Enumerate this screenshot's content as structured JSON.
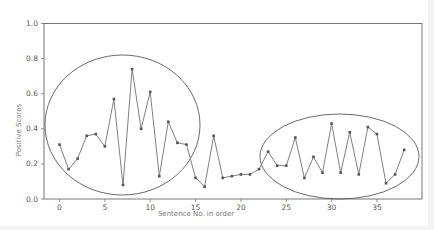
{
  "chart_data": {
    "type": "line",
    "title": "",
    "xlabel": "Sentence No. in order",
    "ylabel": "Positive Scores",
    "xlim": [
      -2,
      40
    ],
    "ylim": [
      0.0,
      1.0
    ],
    "x_ticks": [
      "0",
      "5",
      "10",
      "15",
      "20",
      "25",
      "30",
      "35"
    ],
    "y_ticks": [
      "0.0",
      "0.2",
      "0.4",
      "0.6",
      "0.8",
      "1.0"
    ],
    "grid": false,
    "legend": null,
    "x": [
      0,
      1,
      2,
      3,
      4,
      5,
      6,
      7,
      8,
      9,
      10,
      11,
      12,
      13,
      14,
      15,
      16,
      17,
      18,
      19,
      20,
      21,
      22,
      23,
      24,
      25,
      26,
      27,
      28,
      29,
      30,
      31,
      32,
      33,
      34,
      35,
      36,
      37,
      38
    ],
    "series": [
      {
        "name": "Positive Scores",
        "color": "#808080",
        "values": [
          0.31,
          0.17,
          0.23,
          0.36,
          0.37,
          0.3,
          0.57,
          0.08,
          0.74,
          0.4,
          0.61,
          0.13,
          0.44,
          0.32,
          0.31,
          0.12,
          0.07,
          0.36,
          0.12,
          0.13,
          0.14,
          0.14,
          0.17,
          0.27,
          0.19,
          0.19,
          0.35,
          0.12,
          0.24,
          0.15,
          0.43,
          0.15,
          0.38,
          0.14,
          0.41,
          0.37,
          0.09,
          0.14,
          0.28
        ]
      }
    ],
    "annotations": [
      {
        "type": "ellipse",
        "note": "circled region sentences 0-15"
      },
      {
        "type": "ellipse",
        "note": "circled region sentences 22-38"
      }
    ]
  }
}
